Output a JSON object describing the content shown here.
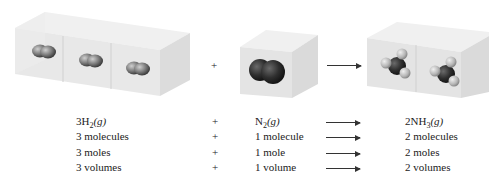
{
  "figure": {
    "top_plus": "+",
    "reactant1": {
      "formula_prefix": "3H",
      "formula_sub": "2",
      "formula_state": "(g)",
      "boxes": 3,
      "molecule": "H2"
    },
    "reactant2": {
      "formula_prefix": "N",
      "formula_sub": "2",
      "formula_state": "(g)",
      "boxes": 1,
      "molecule": "N2"
    },
    "product": {
      "formula_prefix": "2NH",
      "formula_sub": "3",
      "formula_state": "(g)",
      "boxes": 2,
      "molecule": "NH3"
    },
    "rows": [
      {
        "left": "3 molecules",
        "op": "+",
        "mid": "1 molecule",
        "right": "2 molecules"
      },
      {
        "left": "3 moles",
        "op": "+",
        "mid": "1 mole",
        "right": "2 moles"
      },
      {
        "left": "3 volumes",
        "op": "+",
        "mid": "1 volume",
        "right": "2 volumes"
      }
    ],
    "formula_op": "+"
  }
}
